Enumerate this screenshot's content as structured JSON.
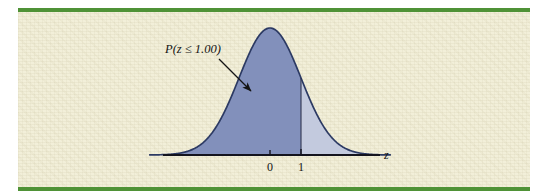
{
  "figure": {
    "background_color": "#f2efd9",
    "page_color": "#ffffff",
    "rule_color": "#4f9236",
    "annotation_label": "P(z ≤ 1.00)",
    "axis_variable": "z"
  },
  "chart_data": {
    "type": "area",
    "title": "",
    "subtitle": "",
    "xlabel": "z",
    "ylabel": "",
    "grid": false,
    "legend_position": "none",
    "distribution": "standard normal",
    "mean": 0,
    "sd": 1,
    "xlim": [
      -3.9,
      3.9
    ],
    "ylim": [
      0,
      0.42
    ],
    "tick_labels": [
      "0",
      "1"
    ],
    "tick_values": [
      0,
      1
    ],
    "shaded_regions": [
      {
        "name": "P(z <= 1.00)",
        "from": -3.9,
        "to": 1.0,
        "color": "#8290bb",
        "label": "P(z ≤ 1.00)",
        "probability": 0.8413
      },
      {
        "name": "P(z > 1.00)",
        "from": 1.0,
        "to": 3.9,
        "color": "#c3cade",
        "label": "",
        "probability": 0.1587
      }
    ],
    "curve_color": "#2c3a63",
    "axis_color": "#14141e",
    "boundary_line_x": 1.0,
    "annotations": [
      {
        "text": "P(z ≤ 1.00)",
        "x": -1.6,
        "y": 0.33,
        "arrow_to_x": -0.6,
        "arrow_to_y": 0.205
      }
    ]
  }
}
